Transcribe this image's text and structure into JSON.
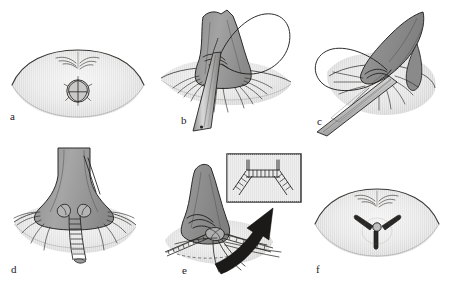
{
  "figure": {
    "background_color": "#ffffff",
    "width": 451,
    "height": 292,
    "style": "grayscale medical line illustration",
    "palette": {
      "ink": "#262322",
      "tissue_fill": "#9a9a9a",
      "tissue_fill_dark": "#828282",
      "tissue_fill_light": "#b4b4b4",
      "field_fill": "#dedede",
      "field_fill_light": "#eaeaea",
      "inset_border": "#2b2828",
      "arrow_fill": "#1e1c1b",
      "instrument_fill": "#c8c8c8",
      "paper": "#ffffff"
    }
  },
  "panels": [
    {
      "id": "a",
      "label": "a",
      "label_x": 10,
      "label_y": 116,
      "caption": "Perineal view showing intact puckered anal orifice within the perineal field",
      "content": "lens-shaped perineal field with central rosette and midline raphe markings",
      "features": [
        "perineal-field-ellipse",
        "midline-raphe",
        "anal-rosette"
      ]
    },
    {
      "id": "b",
      "label": "b",
      "label_x": 181,
      "label_y": 120,
      "caption": "Cone of tissue elevated; suture loop passed and retractor instrument in place",
      "content": "elevated conical flap with large suture loop and handheld instrument",
      "features": [
        "tissue-cone",
        "suture-loop",
        "retractor-instrument",
        "radiating-fibres"
      ]
    },
    {
      "id": "c",
      "label": "c",
      "label_x": 317,
      "label_y": 121,
      "caption": "Cone retracted laterally, exposing the deep plane with suture loop drawn across",
      "content": "cone deflected to the right with suture loop crossing to the left and instrument beneath",
      "features": [
        "tissue-cone-tilted",
        "suture-loop",
        "instrument-shaft",
        "radiating-fibres"
      ]
    },
    {
      "id": "d",
      "label": "d",
      "label_x": 11,
      "label_y": 264,
      "caption": "Continuous ladder suture line completed down the midline",
      "content": "cone reduced with vertical ladder-pattern suture line in midline",
      "features": [
        "tissue-cone",
        "ladder-suture-line",
        "anchor-knots",
        "radiating-fibres"
      ]
    },
    {
      "id": "e",
      "label": "e",
      "label_x": 182,
      "label_y": 265,
      "caption": "Suture ends tied; inset magnifies the completed three-limbed suture construct",
      "content": "cone with multiple chain sutures converging, arrow pointing to magnified inset",
      "features": [
        "tissue-cone",
        "chain-sutures",
        "callout-arrow",
        "detail-inset"
      ],
      "inset": {
        "label": "detail-inset",
        "caption": "Magnified view of the transverse chain suture with two descending limbs",
        "features": [
          "horizontal-chain-suture",
          "left-descending-chain",
          "right-descending-chain",
          "vertical-tails"
        ]
      }
    },
    {
      "id": "f",
      "label": "f",
      "label_x": 316,
      "label_y": 264,
      "caption": "Final perineal appearance with tri-radiate (Y-shaped) closure",
      "content": "lens-shaped perineal field with central Y-shaped scar and midline raphe markings",
      "features": [
        "perineal-field-ellipse",
        "midline-raphe",
        "y-shaped-closure"
      ]
    }
  ]
}
